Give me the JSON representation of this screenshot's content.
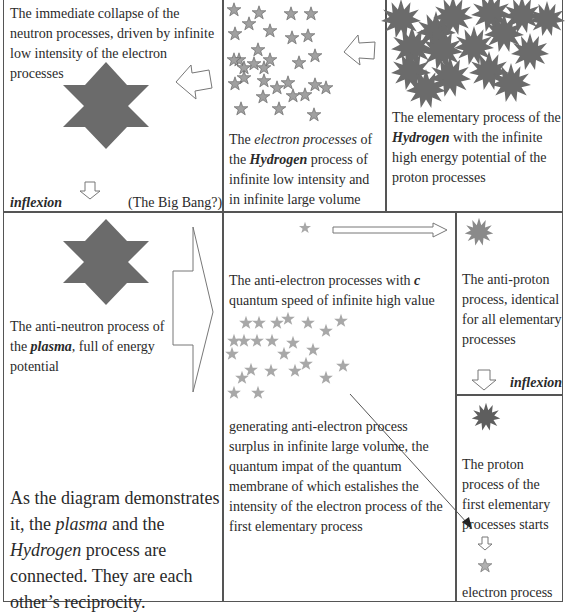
{
  "cells": {
    "top_left": {
      "text": "The immediate collapse of the neutron processes, driven by infinite low intensity of the electron processes",
      "inflexion_label": "inflexion",
      "big_bang_label": "(The Big Bang?)"
    },
    "top_middle": {
      "text_1": "The ",
      "text_2": "electron processes",
      "text_3": " of the ",
      "text_4": "Hydrogen",
      "text_5": " process of infinite low intensity and in infinite large volume"
    },
    "top_right": {
      "text_1": "The elementary process of the ",
      "text_2": "Hydrogen",
      "text_3": " with the infinite high energy potential of the proton processes"
    },
    "bottom_left": {
      "caption_1": "The anti-neutron process of the ",
      "caption_2": "plasma",
      "caption_3": ", full of energy potential",
      "summary_1": "As the diagram demonstrates it, the ",
      "summary_2": "plasma",
      "summary_3": " and the ",
      "summary_4": "Hydrogen",
      "summary_5": " process are connected. They are each other’s reciprocity."
    },
    "bottom_middle": {
      "text_1a": "The anti-electron processes with ",
      "text_1b": "c",
      "text_1c": " quantum speed of infinite high value",
      "text_2": "generating anti-electron process surplus in infinite large volume, the quantum impat of the quantum membrane of which estalishes the intensity of the electron process of the first elementary process"
    },
    "bottom_right_upper": {
      "text": "The anti-proton process, identical for all elementary processes",
      "inflexion_label": "inflexion"
    },
    "bottom_right_lower": {
      "text": "The proton process of the first elementary processes starts",
      "electron_label": "electron process"
    }
  },
  "colors": {
    "shape_fill": "#6b6b6b",
    "star_fill": "#9a9a9a",
    "star_stroke": "#6a6a6a",
    "light_star": "#a8a8a8",
    "border": "#555555"
  }
}
